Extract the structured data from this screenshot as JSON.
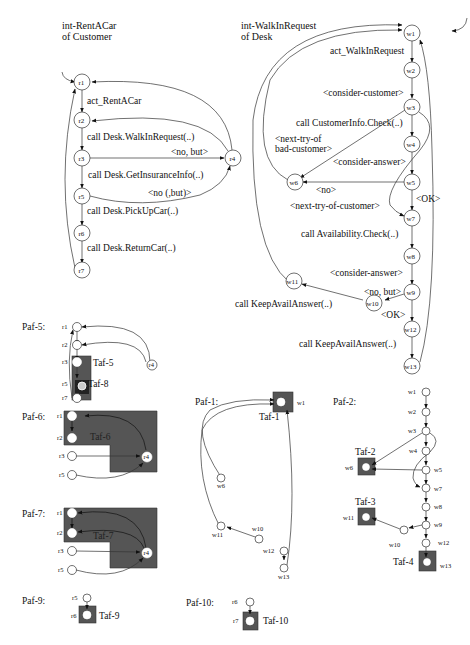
{
  "rentacar": {
    "title_line1": "int-RentACar",
    "title_line2": "of Customer",
    "nodes": [
      "r1",
      "r2",
      "r3",
      "r4",
      "r5",
      "r6",
      "r7"
    ],
    "edges": {
      "r1_r2": "act_RentACar",
      "r2_r3": "call Desk.WalkInRequest(..)",
      "r3_r4": "<no, but>",
      "r3_r5": "call Desk.GetInsuranceInfo(..)",
      "r5_r4": "<no (,but)>",
      "r5_r6": "call Desk.PickUpCar(..)",
      "r6_r7": "call Desk.ReturnCar(..)"
    }
  },
  "walkin": {
    "title_line1": "int-WalkInRequest",
    "title_line2": "of Desk",
    "nodes": [
      "w1",
      "w2",
      "w3",
      "w4",
      "w5",
      "w6",
      "w7",
      "w8",
      "w9",
      "w10",
      "w11",
      "w12",
      "w13"
    ],
    "edges": {
      "w1_w2": "act_WalkInRequest",
      "w2_w3": "<consider-customer>",
      "w3_w4": "call CustomerInfo.Check(..)",
      "w3_w6_a": "<next-try-of",
      "w3_w6_b": "bad-customer>",
      "w4_w5": "<consider-answer>",
      "w5_w6": "<no>",
      "w5_w7": "<OK>",
      "w3_w7": "<next-try-of-customer>",
      "w7_w8": "call Availability.Check(..)",
      "w8_w9": "<consider-answer>",
      "w9_w10": "<no, but>",
      "w10_w11": "call KeepAvailAnswer(..)",
      "w9_w12": "<OK>",
      "w12_w13": "call KeepAvailAnswer(..)"
    }
  },
  "pafs": {
    "paf5": {
      "label": "Paf-5:",
      "tafs": [
        "Taf-5",
        "Taf-8"
      ],
      "nodes": [
        "r1",
        "r2",
        "r3",
        "r4",
        "r5",
        "r7"
      ]
    },
    "paf6": {
      "label": "Paf-6:",
      "tafs": [
        "Taf-6"
      ],
      "nodes": [
        "r1",
        "r2",
        "r3",
        "r4",
        "r5"
      ]
    },
    "paf7": {
      "label": "Paf-7:",
      "tafs": [
        "Taf-7"
      ],
      "nodes": [
        "r1",
        "r2",
        "r3",
        "r4",
        "r5"
      ]
    },
    "paf9": {
      "label": "Paf-9:",
      "tafs": [
        "Taf-9"
      ],
      "nodes": [
        "r5",
        "r6"
      ]
    },
    "paf1": {
      "label": "Paf-1:",
      "tafs": [
        "Taf-1"
      ],
      "nodes": [
        "w1",
        "w6",
        "w10",
        "w11",
        "w12",
        "w13"
      ]
    },
    "paf10": {
      "label": "Paf-10:",
      "tafs": [
        "Taf-10"
      ],
      "nodes": [
        "r6",
        "r7"
      ]
    },
    "paf2": {
      "label": "Paf-2:",
      "tafs": [
        "Taf-2",
        "Taf-3",
        "Taf-4"
      ],
      "nodes": [
        "w1",
        "w2",
        "w3",
        "w4",
        "w5",
        "w6",
        "w7",
        "w8",
        "w9",
        "w10",
        "w11",
        "w12",
        "w13"
      ]
    }
  },
  "colors": {
    "taf_fill": "#555555",
    "stroke": "#333333",
    "background": "#ffffff"
  }
}
